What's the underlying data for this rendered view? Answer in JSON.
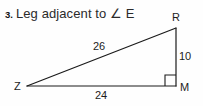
{
  "problem": {
    "number": "3.",
    "prompt": "Leg adjacent to ∠ E"
  },
  "figure": {
    "type": "right-triangle",
    "vertices": [
      {
        "name": "R",
        "label": "R",
        "x": 176,
        "y": 28
      },
      {
        "name": "Z",
        "label": "Z",
        "x": 27,
        "y": 86
      },
      {
        "name": "M",
        "label": "M",
        "x": 176,
        "y": 86
      }
    ],
    "sides": [
      {
        "name": "hypotenuse",
        "from": "Z",
        "to": "R",
        "label": "26"
      },
      {
        "name": "vertical-leg",
        "from": "R",
        "to": "M",
        "label": "10"
      },
      {
        "name": "base-leg",
        "from": "Z",
        "to": "M",
        "label": "24"
      }
    ],
    "right_angle": {
      "at": "M",
      "marker": "square"
    },
    "line_color": "#1a1a1a",
    "background_color": "#fefefe"
  }
}
